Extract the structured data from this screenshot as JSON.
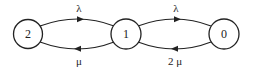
{
  "diagram": {
    "type": "state-transition",
    "nodes": [
      {
        "id": "2",
        "label": "2"
      },
      {
        "id": "1",
        "label": "1"
      },
      {
        "id": "0",
        "label": "0"
      }
    ],
    "edges": [
      {
        "from": "2",
        "to": "1",
        "label": "λ",
        "direction": "right",
        "side": "top"
      },
      {
        "from": "1",
        "to": "2",
        "label": "μ",
        "direction": "left",
        "side": "bottom"
      },
      {
        "from": "1",
        "to": "0",
        "label": "λ",
        "direction": "right",
        "side": "top"
      },
      {
        "from": "0",
        "to": "1",
        "label": "2 μ",
        "direction": "left",
        "side": "bottom"
      }
    ],
    "colors": {
      "stroke": "#222222",
      "background": "#ffffff"
    }
  }
}
